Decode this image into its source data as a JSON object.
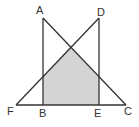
{
  "diagram": {
    "type": "geometry",
    "colors": {
      "line": "#333333",
      "shade": "#d4d4d4",
      "background": "#ffffff"
    },
    "points": {
      "A": {
        "label": "A",
        "x": 43,
        "y": 18
      },
      "D": {
        "label": "D",
        "x": 99,
        "y": 18
      },
      "F": {
        "label": "F",
        "x": 16,
        "y": 105
      },
      "B": {
        "label": "B",
        "x": 43,
        "y": 105
      },
      "E": {
        "label": "E",
        "x": 99,
        "y": 105
      },
      "C": {
        "label": "C",
        "x": 126,
        "y": 105
      }
    },
    "segments": [
      "AB",
      "AC",
      "DE",
      "DF",
      "FC"
    ],
    "shaded_region": "Overlap of triangle ABC and triangle DEF (pentagon bounded by B, AB∩DF, AC∩DF, AC∩DE, E)"
  }
}
